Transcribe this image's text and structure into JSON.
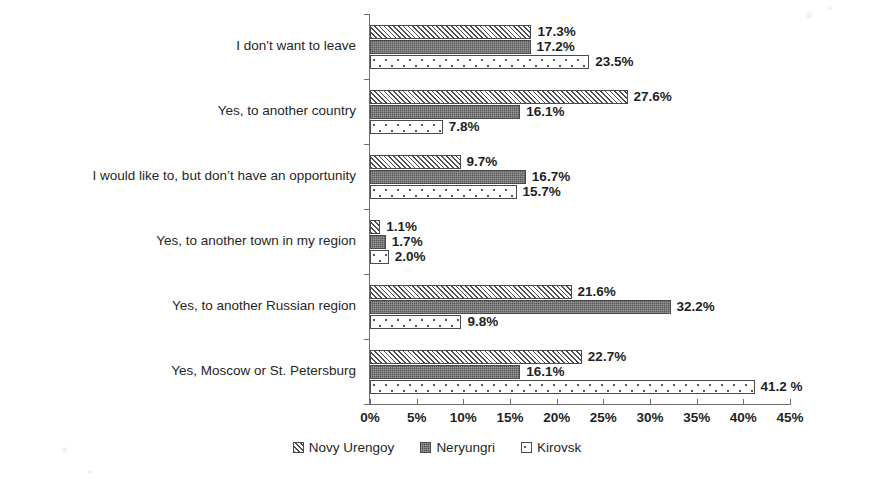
{
  "chart_data": {
    "type": "bar",
    "orientation": "horizontal",
    "title": "",
    "xlabel": "",
    "ylabel": "",
    "xlim": [
      0,
      45
    ],
    "grid": false,
    "legend_position": "bottom",
    "categories": [
      "I don't want to leave",
      "Yes, to another country",
      "I would like to, but don’t have an opportunity",
      "Yes, to another town in my region",
      "Yes, to another Russian region",
      "Yes, Moscow or St. Petersburg"
    ],
    "series": [
      {
        "name": "Novy Urengoy",
        "pattern": "diagonal-hatch",
        "values": [
          17.3,
          27.6,
          9.7,
          1.1,
          21.6,
          22.7
        ],
        "labels": [
          "17.3%",
          "27.6%",
          "9.7%",
          "1.1%",
          "21.6%",
          "22.7%"
        ]
      },
      {
        "name": "Neryungri",
        "pattern": "dark-fill",
        "values": [
          17.2,
          16.1,
          16.7,
          1.7,
          32.2,
          16.1
        ],
        "labels": [
          "17.2%",
          "16.1%",
          "16.7%",
          "1.7%",
          "32.2%",
          "16.1%"
        ]
      },
      {
        "name": "Kirovsk",
        "pattern": "dotted-fill",
        "values": [
          23.5,
          7.8,
          15.7,
          2.0,
          9.8,
          41.2
        ],
        "labels": [
          "23.5%",
          "7.8%",
          "15.7%",
          "2.0%",
          "9.8%",
          "41.2 %"
        ]
      }
    ],
    "x_ticks": [
      0,
      5,
      10,
      15,
      20,
      25,
      30,
      35,
      40,
      45
    ],
    "x_tick_labels": [
      "0%",
      "5%",
      "10%",
      "15%",
      "20%",
      "25%",
      "30%",
      "35%",
      "40%",
      "45%"
    ]
  },
  "legend": {
    "items": [
      {
        "label": "Novy Urengoy",
        "marker": "hatched-square-swatch"
      },
      {
        "label": "Neryungri",
        "marker": "dark-square-swatch"
      },
      {
        "label": "Kirovsk",
        "marker": "dotted-square-swatch"
      }
    ]
  }
}
